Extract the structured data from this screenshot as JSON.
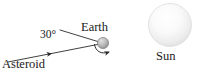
{
  "figure": {
    "name": "asteroid-earth-sun-diagram",
    "background_color": "#ffffff",
    "width": 198,
    "height": 81
  },
  "labels": {
    "earth": "Earth",
    "sun": "Sun",
    "asteroid": "Asteroid",
    "angle": "30°"
  },
  "bodies": {
    "earth": {
      "name": "Earth",
      "center_x": 103,
      "center_y": 43,
      "radius": 5.5,
      "fill_light": "#d8d8d8",
      "fill_dark": "#8f8f8f",
      "outline": "#7a7a7a"
    },
    "sun": {
      "name": "Sun",
      "center_x": 170,
      "center_y": 25,
      "radius": 21.5,
      "fill_light": "#fdfdfd",
      "fill_dark": "#e2e2e2",
      "outline": "#d5d5d5"
    }
  },
  "lines": {
    "trajectory": {
      "name": "asteroid-trajectory",
      "from_x": 8,
      "from_y": 62,
      "to_x": 100,
      "to_y": 44,
      "color": "#2b2b2b",
      "arrow_position": "midpoint",
      "arrow_direction": "toward-earth"
    },
    "reference": {
      "name": "angle-reference-line",
      "from_x": 60,
      "from_y": 30,
      "to_x": 101,
      "to_y": 43,
      "color": "#2b2b2b"
    }
  },
  "rotation_arrow": {
    "name": "earth-rotation-arrow",
    "color": "#2b2b2b",
    "direction": "clockwise"
  },
  "colors": {
    "ink": "#1a1a1a",
    "stroke": "#2b2b2b"
  }
}
